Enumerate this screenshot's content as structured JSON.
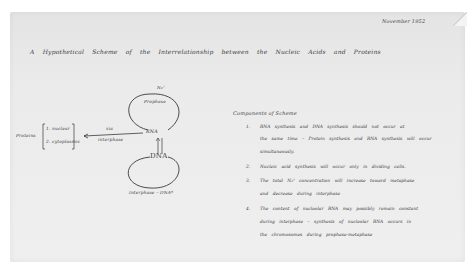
{
  "document": {
    "date": "November 1952",
    "title": "A Hypothetical Scheme of the Interrelationship between the Nucleic Acids and Proteins"
  },
  "diagram": {
    "protein_label": "Proteins",
    "protein_types": [
      "1. nuclear",
      "2. cytoplasmic"
    ],
    "rna_node": "RNA",
    "dna_node": "DNA",
    "rna_loop_label": "Prophase",
    "rna_loop_top_label": "N₂²",
    "arrow_to_protein_top": "via",
    "arrow_to_protein_bottom": "interphase",
    "dna_loop_label": "Interphase – DNA*",
    "vertical_arrow_left": "RNA",
    "vertical_arrow_right": "synthesis"
  },
  "components": {
    "heading": "Components of Scheme",
    "items": [
      {
        "num": "1.",
        "lines": [
          "RNA synthesis and DNA synthesis should not occur at",
          "the same time – Protein synthesis and RNA synthesis will occur",
          "simultaneously."
        ]
      },
      {
        "num": "2.",
        "lines": [
          "Nucleic acid synthesis will occur only in dividing cells."
        ]
      },
      {
        "num": "3.",
        "lines": [
          "The total N₂² concentration will increase toward metaphase",
          "and decrease during interphase"
        ]
      },
      {
        "num": "4.",
        "lines": [
          "The content of nucleolar RNA may possibly remain constant",
          "during interphase – synthesis of nucleolar RNA occurs in",
          "the chromosomes during prophase-metaphase"
        ]
      }
    ]
  },
  "colors": {
    "paper": "#ebebeb",
    "ink": "#3c3c3c",
    "background": "#ffffff"
  }
}
